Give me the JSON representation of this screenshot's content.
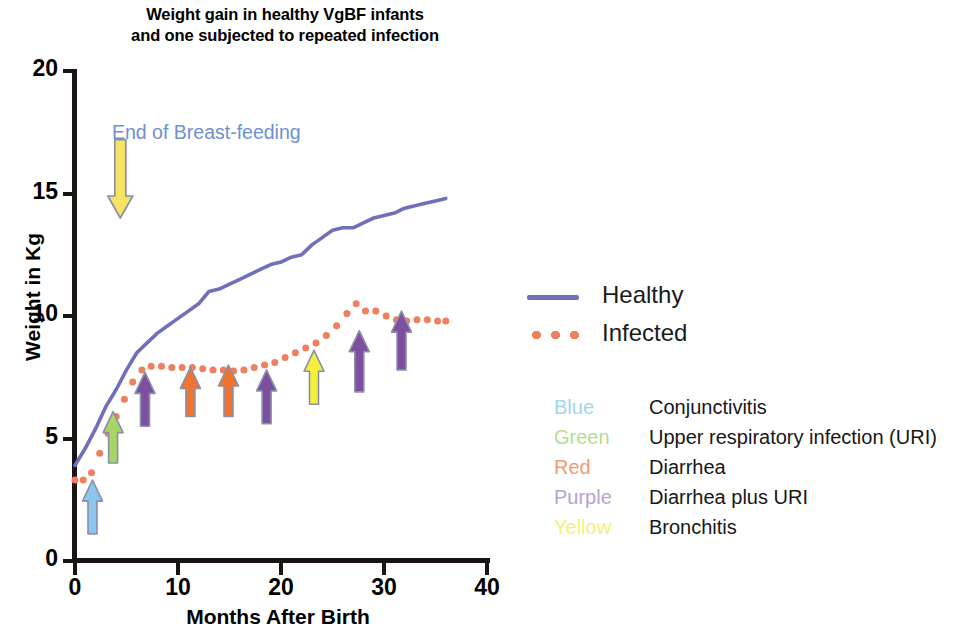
{
  "chart_data": {
    "type": "line",
    "title": "Weight gain in healthy VgBF infants and one subjected to repeated infection",
    "title_line1": "Weight gain in healthy VgBF infants",
    "title_line2": "and one subjected to repeated infection",
    "xlabel": "Months After Birth",
    "ylabel": "Weight in Kg",
    "xlim": [
      0,
      40
    ],
    "ylim": [
      0,
      20
    ],
    "xticks": [
      0,
      10,
      20,
      30,
      40
    ],
    "yticks": [
      0,
      5,
      10,
      15,
      20
    ],
    "grid": false,
    "legend_position": "right",
    "series": [
      {
        "name": "Healthy",
        "style": "solid",
        "color": "#6f6fba",
        "x": [
          0,
          1,
          2,
          3,
          4,
          5,
          6,
          7,
          8,
          9,
          10,
          11,
          12,
          13,
          14,
          15,
          16,
          17,
          18,
          19,
          20,
          21,
          22,
          23,
          24,
          25,
          26,
          27,
          28,
          29,
          30,
          31,
          32,
          33,
          34,
          35,
          36
        ],
        "y": [
          3.9,
          4.6,
          5.4,
          6.3,
          7.0,
          7.8,
          8.5,
          8.9,
          9.3,
          9.6,
          9.9,
          10.2,
          10.5,
          11.0,
          11.1,
          11.3,
          11.5,
          11.7,
          11.9,
          12.1,
          12.2,
          12.4,
          12.5,
          12.9,
          13.2,
          13.5,
          13.6,
          13.6,
          13.8,
          14.0,
          14.1,
          14.2,
          14.4,
          14.5,
          14.6,
          14.7,
          14.8
        ]
      },
      {
        "name": "Infected",
        "style": "dotted",
        "color": "#ef7f5f",
        "x": [
          0,
          0.8,
          1.6,
          2.4,
          3.2,
          4.0,
          4.8,
          5.6,
          6.5,
          7.4,
          8.4,
          9.4,
          10.4,
          11.4,
          12.4,
          13.4,
          14.4,
          15.4,
          16.4,
          17.4,
          18.4,
          19.4,
          20.4,
          21.4,
          22.4,
          23.4,
          24.4,
          25.4,
          26.4,
          27.3,
          28.2,
          29.2,
          30.2,
          31.2,
          32.2,
          33.2,
          34.2,
          35.2,
          36.0
        ],
        "y": [
          3.3,
          3.3,
          3.6,
          4.4,
          5.2,
          5.9,
          6.6,
          7.3,
          7.8,
          7.95,
          7.95,
          7.9,
          7.9,
          7.9,
          7.85,
          7.8,
          7.8,
          7.75,
          7.8,
          7.9,
          8.0,
          8.1,
          8.3,
          8.5,
          8.7,
          8.9,
          9.2,
          9.6,
          10.1,
          10.5,
          10.2,
          10.2,
          10.0,
          9.85,
          9.8,
          9.85,
          9.85,
          9.8,
          9.8
        ]
      }
    ],
    "annotations": [
      {
        "text": "End of Breast-feeding",
        "text_color": "#6f8fd4",
        "arrow_direction": "down",
        "arrow_color": "#f7e463",
        "arrow_x_month": 4.4,
        "arrow_y_top_kg": 17.2,
        "arrow_y_bottom_kg": 14.0
      }
    ],
    "event_arrows": [
      {
        "color_name": "Blue",
        "color": "#8cc6ee",
        "x_month": 1.7,
        "base_kg": 1.1,
        "tip_kg": 3.3
      },
      {
        "color_name": "Green",
        "color": "#a9d468",
        "x_month": 3.7,
        "base_kg": 4.0,
        "tip_kg": 6.1
      },
      {
        "color_name": "Purple",
        "color": "#7d4fa0",
        "x_month": 6.8,
        "base_kg": 5.5,
        "tip_kg": 7.7
      },
      {
        "color_name": "Red",
        "color": "#f0742f",
        "x_month": 11.2,
        "base_kg": 5.9,
        "tip_kg": 7.9
      },
      {
        "color_name": "Red",
        "color": "#f0742f",
        "x_month": 14.9,
        "base_kg": 5.9,
        "tip_kg": 8.0
      },
      {
        "color_name": "Purple",
        "color": "#7d4fa0",
        "x_month": 18.6,
        "base_kg": 5.6,
        "tip_kg": 7.8
      },
      {
        "color_name": "Yellow",
        "color": "#f5ef3c",
        "x_month": 23.2,
        "base_kg": 6.4,
        "tip_kg": 8.6
      },
      {
        "color_name": "Purple",
        "color": "#7d4fa0",
        "x_month": 27.6,
        "base_kg": 6.9,
        "tip_kg": 9.4
      },
      {
        "color_name": "Purple",
        "color": "#7d4fa0",
        "x_month": 31.7,
        "base_kg": 7.8,
        "tip_kg": 10.2
      }
    ]
  },
  "legend": {
    "items": [
      {
        "label": "Healthy",
        "style": "solid",
        "color": "#6f6fba"
      },
      {
        "label": "Infected",
        "style": "dotted",
        "color": "#ef7f5f"
      }
    ]
  },
  "color_key": {
    "rows": [
      {
        "color_word": "Blue",
        "color": "#9fd6f0",
        "description": "Conjunctivitis"
      },
      {
        "color_word": "Green",
        "color": "#b6dd8e",
        "description": "Upper respiratory infection (URI)"
      },
      {
        "color_word": "Red",
        "color": "#f09a7a",
        "description": "Diarrhea"
      },
      {
        "color_word": "Purple",
        "color": "#b9a2cf",
        "description": "Diarrhea plus URI"
      },
      {
        "color_word": "Yellow",
        "color": "#f6ef7a",
        "description": "Bronchitis"
      }
    ]
  }
}
